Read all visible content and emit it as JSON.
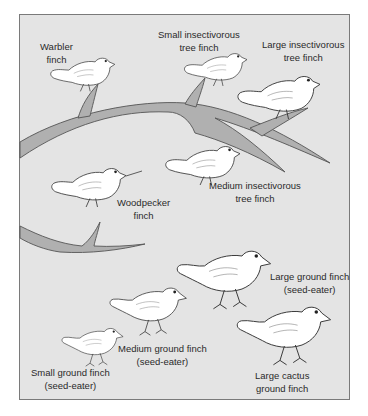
{
  "figure": {
    "colors": {
      "background": "#e4e4e4",
      "branch": "#b0b0b0",
      "outline": "#3a3a3a",
      "bird_fill": "#ffffff"
    }
  },
  "labels": {
    "warbler": {
      "line1": "Warbler",
      "line2": "finch"
    },
    "small_insectivorous": {
      "line1": "Small insectivorous",
      "line2": "tree finch"
    },
    "large_insectivorous": {
      "line1": "Large insectivorous",
      "line2": "tree finch"
    },
    "medium_insectivorous": {
      "line1": "Medium insectivorous",
      "line2": "tree finch"
    },
    "woodpecker": {
      "line1": "Woodpecker",
      "line2": "finch"
    },
    "large_ground": {
      "line1": "Large ground finch",
      "line2": "(seed-eater)"
    },
    "medium_ground": {
      "line1": "Medium ground finch",
      "line2": "(seed-eater)"
    },
    "small_ground": {
      "line1": "Small ground finch",
      "line2": "(seed-eater)"
    },
    "large_cactus": {
      "line1": "Large cactus",
      "line2": "ground finch"
    }
  }
}
